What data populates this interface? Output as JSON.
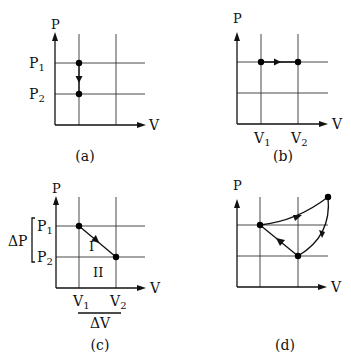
{
  "panels": [
    {
      "id": "a",
      "caption": "(a)",
      "axis_labels": {
        "y": "P",
        "x": "V"
      },
      "tick_labels": {
        "p1": "P",
        "p1_sub": "1",
        "p2": "P",
        "p2_sub": "2"
      },
      "description": "Isochoric process: pressure drops from P1 to P2 at constant volume"
    },
    {
      "id": "b",
      "caption": "(b)",
      "axis_labels": {
        "y": "P",
        "x": "V"
      },
      "tick_labels": {
        "v1": "V",
        "v1_sub": "1",
        "v2": "V",
        "v2_sub": "2"
      },
      "description": "Isobaric process: volume increases from V1 to V2 at constant pressure"
    },
    {
      "id": "c",
      "caption": "(c)",
      "axis_labels": {
        "y": "P",
        "x": "V"
      },
      "tick_labels": {
        "p1": "P",
        "p1_sub": "1",
        "p2": "P",
        "p2_sub": "2",
        "v1": "V",
        "v1_sub": "1",
        "v2": "V",
        "v2_sub": "2"
      },
      "region_labels": {
        "upper": "I",
        "lower": "II"
      },
      "delta_labels": {
        "dp": "ΔP",
        "dv": "ΔV"
      },
      "description": "Linear process from (V1,P1) to (V2,P2); areas I (triangle) and II (rectangle)"
    },
    {
      "id": "d",
      "caption": "(d)",
      "axis_labels": {
        "y": "P",
        "x": "V"
      },
      "description": "Cyclic process with three states"
    }
  ]
}
